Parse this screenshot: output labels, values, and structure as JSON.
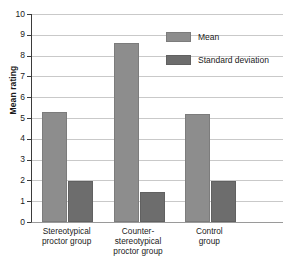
{
  "chart_data": {
    "type": "bar",
    "title": "",
    "xlabel": "",
    "ylabel": "Mean rating",
    "ylim": [
      0,
      10
    ],
    "ytick_labels": [
      "10",
      "9",
      "8",
      "7",
      "6",
      "5",
      "4",
      "3",
      "2",
      "1",
      "0"
    ],
    "yticks": [
      10,
      9,
      8,
      7,
      6,
      5,
      4,
      3,
      2,
      1,
      0
    ],
    "grid": true,
    "legend_position": "upper right",
    "categories": [
      "Stereotypical proctor group",
      "Counter-stereotypical proctor group",
      "Control group"
    ],
    "category_lines": [
      [
        "Stereotypical",
        "proctor group"
      ],
      [
        "Counter-",
        "stereotypical",
        "proctor group"
      ],
      [
        "Control",
        "group"
      ]
    ],
    "series": [
      {
        "name": "Mean",
        "color": "#8d8d8d",
        "values": [
          5.3,
          8.62,
          5.17
        ]
      },
      {
        "name": "Standard deviation",
        "color": "#6d6d6d",
        "values": [
          1.95,
          1.45,
          1.97
        ]
      }
    ]
  },
  "legend": {
    "items": [
      {
        "label": "Mean",
        "swatch": "mean-swatch"
      },
      {
        "label": "Standard deviation",
        "swatch": "standard-deviation-swatch"
      }
    ]
  },
  "axes": {
    "y_title": "Mean rating"
  }
}
